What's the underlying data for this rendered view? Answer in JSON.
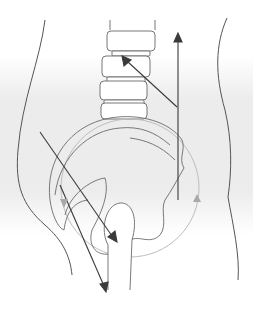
{
  "diagram": {
    "type": "anatomical-illustration",
    "labels": [],
    "colors": {
      "background": "#ffffff",
      "shading_band": "#e9e9e9",
      "outline": "#555555",
      "bone_outline": "#6a6a6a",
      "pelvis_circle": "#bdbdbd",
      "arrow_dark": "#3a3a3a",
      "arrow_light": "#a8a8a8"
    },
    "elements": {
      "body_contour_left": "outer body outline, left side",
      "body_contour_right": "outer body outline, right side",
      "vertebrae": [
        "L1",
        "L2",
        "L3",
        "L4",
        "L5"
      ],
      "pelvis": "ilium/sacrum outline",
      "rotation_circle": "pelvic rotation circle",
      "femur": "femoral head and shaft",
      "arrows": [
        {
          "id": "vertical-up-arrow",
          "color": "dark",
          "direction": "up"
        },
        {
          "id": "diagonal-to-spine-arrow",
          "color": "dark",
          "direction": "up-left"
        },
        {
          "id": "diagonal-to-femur-head-arrow",
          "color": "dark",
          "direction": "down-right"
        },
        {
          "id": "diagonal-down-arrow",
          "color": "dark",
          "direction": "down-right"
        },
        {
          "id": "circle-rotation-arrow-left",
          "color": "light",
          "direction": "down"
        },
        {
          "id": "circle-rotation-arrow-right",
          "color": "light",
          "direction": "up"
        }
      ]
    }
  }
}
